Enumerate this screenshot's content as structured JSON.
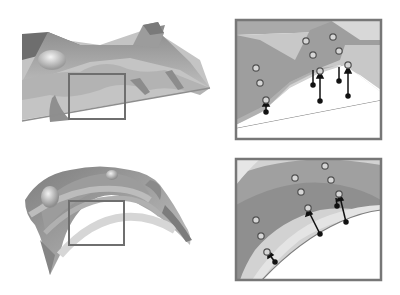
{
  "figure": {
    "panels": [
      {
        "id": "top-surface",
        "description": "3D rendered terrain-like surface with highlight box",
        "highlight_box": {
          "x": 68,
          "y": 73,
          "w": 57,
          "h": 45
        }
      },
      {
        "id": "top-inset",
        "description": "Zoomed inset of top surface showing sample points with projection arrows",
        "box": {
          "x": 236,
          "y": 20,
          "w": 145,
          "h": 119
        },
        "points": [
          {
            "x": 255,
            "y": 68
          },
          {
            "x": 260,
            "y": 83
          },
          {
            "x": 266,
            "y": 100
          },
          {
            "x": 307,
            "y": 42
          },
          {
            "x": 313,
            "y": 55
          },
          {
            "x": 318,
            "y": 72
          },
          {
            "x": 332,
            "y": 37
          },
          {
            "x": 339,
            "y": 51
          },
          {
            "x": 347,
            "y": 65
          }
        ],
        "arrows": [
          {
            "x1": 266,
            "y1": 112,
            "x2": 266,
            "y2": 103
          },
          {
            "x1": 318,
            "y1": 100,
            "x2": 318,
            "y2": 75
          },
          {
            "x1": 312,
            "y1": 70,
            "x2": 312,
            "y2": 85,
            "down": true
          },
          {
            "x1": 339,
            "y1": 66,
            "x2": 339,
            "y2": 80,
            "down": true
          },
          {
            "x1": 347,
            "y1": 95,
            "x2": 347,
            "y2": 68
          }
        ]
      },
      {
        "id": "bottom-surface",
        "description": "3D rendered curved shell surface with highlight box",
        "highlight_box": {
          "x": 68,
          "y": 201,
          "w": 56,
          "h": 45
        }
      },
      {
        "id": "bottom-inset",
        "description": "Zoomed inset of bottom surface showing sample points with projection arrows",
        "box": {
          "x": 236,
          "y": 159,
          "w": 145,
          "h": 121
        },
        "points": [
          {
            "x": 256,
            "y": 220
          },
          {
            "x": 261,
            "y": 236
          },
          {
            "x": 267,
            "y": 252
          },
          {
            "x": 295,
            "y": 178
          },
          {
            "x": 300,
            "y": 192
          },
          {
            "x": 307,
            "y": 209
          },
          {
            "x": 325,
            "y": 166
          },
          {
            "x": 331,
            "y": 180
          },
          {
            "x": 338,
            "y": 195
          }
        ],
        "arrows": [
          {
            "x1": 275,
            "y1": 261,
            "x2": 269,
            "y2": 253
          },
          {
            "x1": 319,
            "y1": 233,
            "x2": 308,
            "y2": 211
          },
          {
            "x1": 345,
            "y1": 222,
            "x2": 339,
            "y2": 197
          }
        ]
      }
    ],
    "colors": {
      "frame": "#7a7a7a",
      "surface_dark": "#8c8c8c",
      "surface_mid": "#a9a9a9",
      "surface_light": "#d4d4d4",
      "point_fill": "#d9d9d9",
      "point_stroke": "#555555",
      "arrow": "#111111"
    }
  }
}
